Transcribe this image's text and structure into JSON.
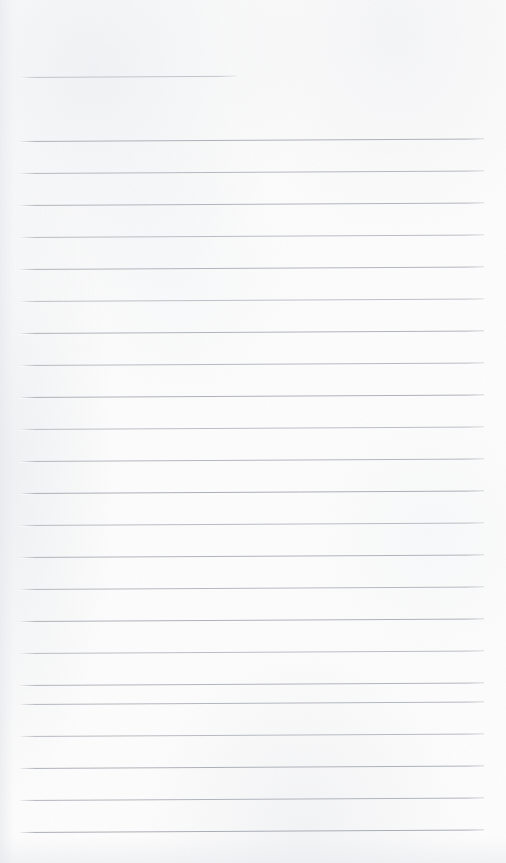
{
  "page": {
    "kind": "lined-writing-paper",
    "width": 506,
    "height": 863,
    "background_color": "#fcfcfc",
    "has_text": false,
    "text_content": ""
  },
  "ruling": {
    "line_color": "#b2b6bd",
    "line_thickness_px": 1,
    "left_margin_px": 20,
    "right_edge_px": 484,
    "line_spacing_px": 32,
    "tilt_deg": -0.3,
    "total_lines": 23,
    "header_rule": {
      "name": "header-rule",
      "y": 77,
      "x_start": 20,
      "x_end": 236,
      "width_px": 216,
      "color": "#b9bcc3",
      "opacity": 0.85
    },
    "body_rules": [
      {
        "y": 141,
        "x_start": 20,
        "x_end": 484,
        "opacity": 0.95,
        "color": "#aaaeb6"
      },
      {
        "y": 173,
        "x_start": 20,
        "x_end": 484,
        "opacity": 0.92,
        "color": "#b0b4bb"
      },
      {
        "y": 205,
        "x_start": 20,
        "x_end": 484,
        "opacity": 0.95,
        "color": "#aeb2ba"
      },
      {
        "y": 237,
        "x_start": 20,
        "x_end": 484,
        "opacity": 0.9,
        "color": "#b3b7be"
      },
      {
        "y": 269,
        "x_start": 20,
        "x_end": 484,
        "opacity": 0.93,
        "color": "#adb1b9"
      },
      {
        "y": 301,
        "x_start": 20,
        "x_end": 484,
        "opacity": 0.88,
        "color": "#b5b9c0"
      },
      {
        "y": 333,
        "x_start": 20,
        "x_end": 484,
        "opacity": 0.94,
        "color": "#acb0b8"
      },
      {
        "y": 365,
        "x_start": 20,
        "x_end": 484,
        "opacity": 0.91,
        "color": "#b1b5bc"
      },
      {
        "y": 397,
        "x_start": 20,
        "x_end": 484,
        "opacity": 0.95,
        "color": "#aaaeb6"
      },
      {
        "y": 429,
        "x_start": 20,
        "x_end": 484,
        "opacity": 0.89,
        "color": "#b4b8bf"
      },
      {
        "y": 461,
        "x_start": 20,
        "x_end": 484,
        "opacity": 0.93,
        "color": "#aeb2ba"
      },
      {
        "y": 493,
        "x_start": 20,
        "x_end": 484,
        "opacity": 0.96,
        "color": "#a9adb5"
      },
      {
        "y": 525,
        "x_start": 20,
        "x_end": 484,
        "opacity": 0.9,
        "color": "#b2b6bd"
      },
      {
        "y": 557,
        "x_start": 20,
        "x_end": 484,
        "opacity": 0.94,
        "color": "#acb0b8"
      },
      {
        "y": 589,
        "x_start": 20,
        "x_end": 484,
        "opacity": 0.92,
        "color": "#b0b4bb"
      },
      {
        "y": 621,
        "x_start": 20,
        "x_end": 484,
        "opacity": 0.95,
        "color": "#aaaeb6"
      },
      {
        "y": 653,
        "x_start": 20,
        "x_end": 484,
        "opacity": 0.9,
        "color": "#b3b7be"
      },
      {
        "y": 685,
        "x_start": 20,
        "x_end": 484,
        "opacity": 0.94,
        "color": "#adb1b9"
      },
      {
        "y": 704,
        "x_start": 20,
        "x_end": 484,
        "opacity": 0.93,
        "color": "#aeb2ba"
      },
      {
        "y": 736,
        "x_start": 20,
        "x_end": 484,
        "opacity": 0.91,
        "color": "#b1b5bc"
      },
      {
        "y": 768,
        "x_start": 20,
        "x_end": 484,
        "opacity": 0.95,
        "color": "#aaaeb6"
      },
      {
        "y": 800,
        "x_start": 20,
        "x_end": 484,
        "opacity": 0.93,
        "color": "#acb0b8"
      },
      {
        "y": 832,
        "x_start": 20,
        "x_end": 484,
        "opacity": 0.96,
        "color": "#a7abb3"
      }
    ]
  }
}
